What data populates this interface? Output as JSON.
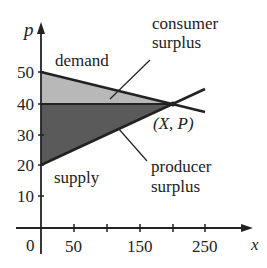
{
  "diagram": {
    "axis_y_label": "p",
    "axis_x_label": "x",
    "y_ticks": [
      "50",
      "40",
      "30",
      "20",
      "10"
    ],
    "x_ticks": [
      "0",
      "50",
      "150",
      "250"
    ],
    "labels": {
      "demand": "demand",
      "supply": "supply",
      "consumer_surplus_line1": "consumer",
      "consumer_surplus_line2": "surplus",
      "producer_surplus_line1": "producer",
      "producer_surplus_line2": "surplus",
      "equilibrium": "(X, P)"
    },
    "colors": {
      "consumer_surplus_fill": "#b8b8b8",
      "producer_surplus_fill": "#555555",
      "line": "#222222"
    }
  }
}
